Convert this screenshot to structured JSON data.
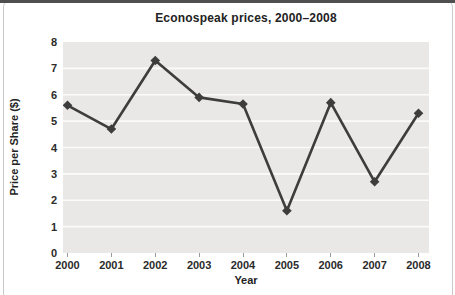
{
  "figure": {
    "title": "Econospeak prices, 2000–2008",
    "x_axis_title": "Year",
    "y_axis_title": "Price per Share ($)"
  },
  "chart_data": {
    "type": "line",
    "title": "Econospeak prices, 2000–2008",
    "xlabel": "Year",
    "ylabel": "Price per Share ($)",
    "categories": [
      "2000",
      "2001",
      "2002",
      "2003",
      "2004",
      "2005",
      "2006",
      "2007",
      "2008"
    ],
    "values": [
      5.6,
      4.7,
      7.3,
      5.9,
      5.65,
      1.6,
      5.7,
      2.7,
      5.3
    ],
    "ylim": [
      0,
      8
    ],
    "ytick_interval": 1,
    "yticks": [
      0,
      1,
      2,
      3,
      4,
      5,
      6,
      7,
      8
    ],
    "grid": "horizontal",
    "legend": "none",
    "marker": "diamond"
  },
  "colors": {
    "plot_background": "#e9e8e6",
    "gridline": "#fbfbfb",
    "line": "#3d3d3d",
    "marker": "#3d3d3d",
    "text": "#222222",
    "frame_border": "#c9c9c9",
    "top_bar": "#4f4f4f",
    "tick_mark": "#9a9a9a"
  }
}
